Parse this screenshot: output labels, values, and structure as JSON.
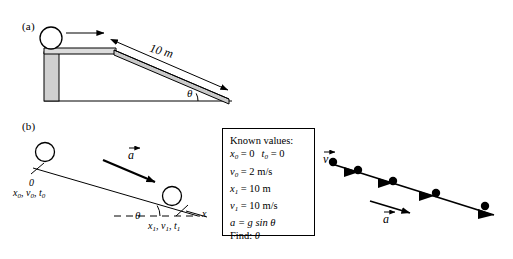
{
  "figure": {
    "panels": [
      {
        "id": "a",
        "label": "(a)"
      },
      {
        "id": "b",
        "label": "(b)"
      }
    ],
    "colors": {
      "stroke": "#000000",
      "ramp_fill": "#c9c9c9",
      "platform_fill": "#d4d4d4",
      "background": "#ffffff"
    }
  },
  "panel_a": {
    "label": "(a)",
    "length_label": "10 m",
    "angle_label": "θ",
    "ball_name": "ball",
    "push_arrow_name": "motion-arrow"
  },
  "panel_b": {
    "label": "(b)",
    "origin_label": "0",
    "state0": {
      "x": "x",
      "x_sub": "0",
      "v": "v",
      "v_sub": "0",
      "t": "t",
      "t_sub": "0",
      "text": "x0, v0, t0"
    },
    "state1": {
      "x": "x",
      "x_sub": "1",
      "v": "v",
      "v_sub": "1",
      "t": "t",
      "t_sub": "1",
      "text": "x1, v1, t1"
    },
    "axis_label": "x",
    "angle_label": "θ",
    "accel_label": "a"
  },
  "known_values": {
    "title": "Known values:",
    "rows": [
      {
        "lhs": "x",
        "lhs_sub": "0",
        "eq": "= 0",
        "extra_lhs": "t",
        "extra_lhs_sub": "0",
        "extra_eq": "= 0"
      },
      {
        "lhs": "v",
        "lhs_sub": "0",
        "eq": "= 2 m/s"
      },
      {
        "lhs": "x",
        "lhs_sub": "1",
        "eq": "= 10 m"
      },
      {
        "lhs": "v",
        "lhs_sub": "1",
        "eq": "= 10 m/s"
      },
      {
        "lhs": "a",
        "lhs_sub": "",
        "eq": "= g sin θ"
      }
    ],
    "find_prefix": "Find:",
    "find_value": "θ"
  },
  "motion_diagram": {
    "velocity_label": "v",
    "accel_label": "a",
    "dot_count": 5,
    "dots": [
      {
        "x": 333,
        "y": 162
      },
      {
        "x": 358,
        "y": 172
      },
      {
        "x": 393,
        "y": 183
      },
      {
        "x": 436,
        "y": 195
      },
      {
        "x": 485,
        "y": 208
      }
    ]
  }
}
